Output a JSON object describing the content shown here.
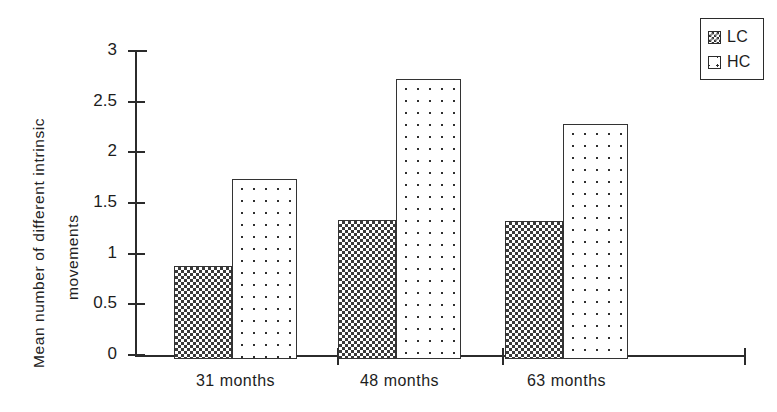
{
  "chart_data": {
    "type": "bar",
    "title": "",
    "xlabel": "",
    "ylabel": "Mean number of different intrinsic movements",
    "ylabel_lines": [
      "Mean  number  of  different  intrinsic",
      "movements"
    ],
    "categories": [
      "31 months",
      "48 months",
      "63 months"
    ],
    "series": [
      {
        "name": "LC",
        "values": [
          0.92,
          1.37,
          1.36
        ],
        "pattern": "dense-checker",
        "color": "#3a3a3a"
      },
      {
        "name": "HC",
        "values": [
          1.78,
          2.76,
          2.32
        ],
        "pattern": "sparse-dots",
        "color": "#2f2f2f"
      }
    ],
    "ylim": [
      0,
      3
    ],
    "yticks": [
      0,
      0.5,
      1,
      1.5,
      2,
      2.5,
      3
    ],
    "ytick_labels": [
      "0",
      "0.5",
      "1",
      "1.5",
      "2",
      "2.5",
      "3"
    ],
    "grid": false,
    "legend_position": "top-right",
    "legend_entries": [
      "LC",
      "HC"
    ],
    "axis_color": "#2b2b2b",
    "background": "#ffffff"
  }
}
